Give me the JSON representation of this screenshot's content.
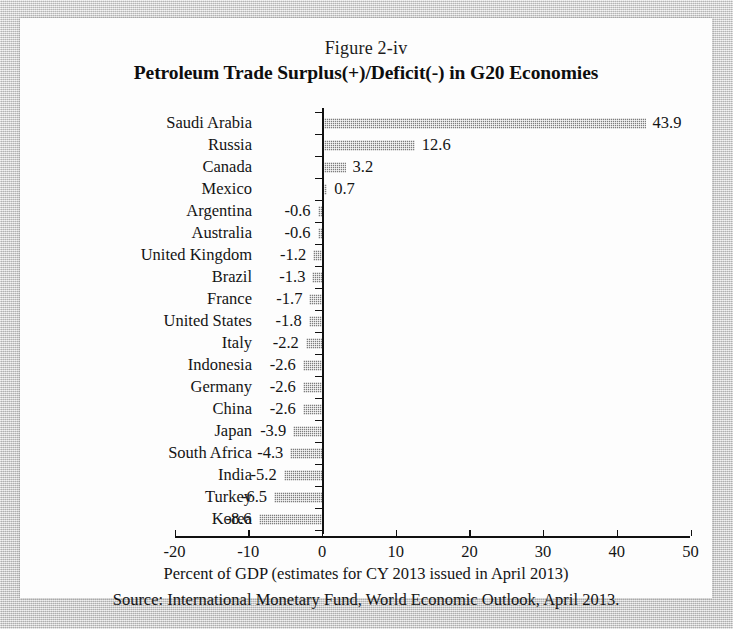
{
  "figure_label": "Figure 2-iv",
  "title": "Petroleum Trade Surplus(+)/Deficit(-) in G20 Economies",
  "xaxis_title": "Percent of GDP (estimates for CY 2013 issued in April 2013)",
  "source": "Source: International Monetary Fund, World Economic Outlook, April 2013.",
  "bar_color": "#7d7d7d",
  "axis_color": "#111111",
  "page_color": "#fdfdfd",
  "chart_data": {
    "type": "bar",
    "orientation": "horizontal",
    "title": "Petroleum Trade Surplus(+)/Deficit(-) in G20 Economies",
    "subtitle": "Figure 2-iv",
    "xlabel": "Percent of GDP (estimates for CY 2013 issued in April 2013)",
    "ylabel": "",
    "xlim": [
      -20,
      50
    ],
    "xticks": [
      "-20",
      "-10",
      "0",
      "10",
      "20",
      "30",
      "40",
      "50"
    ],
    "xtick_values": [
      -20,
      -10,
      0,
      10,
      20,
      30,
      40,
      50
    ],
    "grid": false,
    "legend": "none",
    "source": "Source: International Monetary Fund, World Economic Outlook, April 2013.",
    "categories": [
      "Saudi Arabia",
      "Russia",
      "Canada",
      "Mexico",
      "Argentina",
      "Australia",
      "United Kingdom",
      "Brazil",
      "France",
      "United States",
      "Italy",
      "Indonesia",
      "Germany",
      "China",
      "Japan",
      "South Africa",
      "India",
      "Turkey",
      "Korea"
    ],
    "values": [
      43.9,
      12.6,
      3.2,
      0.7,
      -0.6,
      -0.6,
      -1.2,
      -1.3,
      -1.7,
      -1.8,
      -2.2,
      -2.6,
      -2.6,
      -2.6,
      -3.9,
      -4.3,
      -5.2,
      -6.5,
      -8.6
    ],
    "value_labels": [
      "43.9",
      "12.6",
      "3.2",
      "0.7",
      "-0.6",
      "-0.6",
      "-1.2",
      "-1.3",
      "-1.7",
      "-1.8",
      "-2.2",
      "-2.6",
      "-2.6",
      "-2.6",
      "-3.9",
      "-4.3",
      "-5.2",
      "-6.5",
      "-8.6"
    ]
  }
}
